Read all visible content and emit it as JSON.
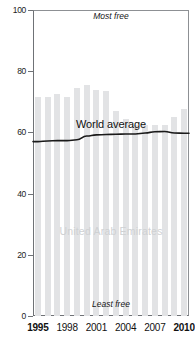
{
  "chart_data": {
    "type": "bar",
    "title": "",
    "xlabel": "",
    "ylabel": "",
    "ylim": [
      0,
      100
    ],
    "xlim": [
      1995,
      2010
    ],
    "grid": false,
    "legend_position": "inline-annotation",
    "categories": [
      1995,
      1996,
      1997,
      1998,
      1999,
      2000,
      2001,
      2002,
      2003,
      2004,
      2005,
      2006,
      2007,
      2008,
      2009,
      2010
    ],
    "series": [
      {
        "name": "United Arab Emirates",
        "type": "bar",
        "color": "#e2e3e5",
        "values": [
          71.5,
          71.5,
          72.5,
          71.5,
          74.5,
          75.5,
          74.0,
          73.5,
          67.0,
          64.5,
          62.5,
          62.5,
          62.5,
          62.5,
          65.0,
          67.5
        ]
      },
      {
        "name": "World average",
        "type": "line",
        "color": "#1a1a1a",
        "values": [
          57.0,
          57.2,
          57.3,
          57.3,
          57.6,
          58.8,
          59.2,
          59.3,
          59.4,
          59.5,
          59.5,
          59.8,
          60.2,
          60.3,
          59.8,
          59.7
        ]
      }
    ],
    "yticks": [
      0,
      20,
      40,
      60,
      80,
      100
    ],
    "ytick_labels": [
      "0",
      "20",
      "40",
      "60",
      "80",
      "100"
    ],
    "xticks": [
      1995,
      1998,
      2001,
      2004,
      2007,
      2010
    ],
    "xtick_labels": [
      "1995",
      "1998",
      "2001",
      "2004",
      "2007",
      "2010"
    ],
    "annotations": {
      "top": "Most free",
      "bottom": "Least free",
      "bar_series_label": "United Arab Emirates",
      "line_series_label": "World average"
    },
    "colors": {
      "bar": "#e2e3e5",
      "line": "#1a1a1a",
      "axis": "#6f7276",
      "country_label": "#cfd1d3"
    }
  }
}
